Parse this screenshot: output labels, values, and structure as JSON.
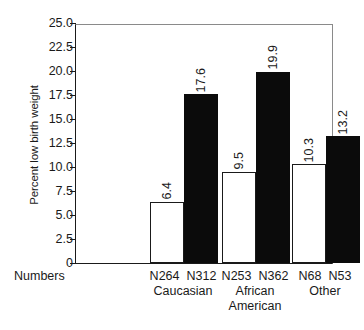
{
  "chart_data": {
    "type": "bar",
    "title": "",
    "xlabel": "",
    "ylabel": "Percent low birth weight",
    "ylim": [
      0,
      25.0
    ],
    "yticks": [
      "0",
      "2.5",
      "5.0",
      "7.5",
      "10.0",
      "12.5",
      "15.0",
      "17.5",
      "20.0",
      "22.5",
      "25.0"
    ],
    "ytick_values": [
      0,
      2.5,
      5,
      7.5,
      10,
      12.5,
      15,
      17.5,
      20,
      22.5,
      25
    ],
    "grid": false,
    "legend": "none",
    "categories": [
      "Caucasian",
      "African American",
      "Other"
    ],
    "series": [
      {
        "name": "open-bar",
        "style": "white-fill-black-outline",
        "values": [
          6.4,
          9.5,
          10.3
        ],
        "labels": [
          "6.4",
          "9.5",
          "10.3"
        ],
        "counts": [
          "N264",
          "N253",
          "N68"
        ]
      },
      {
        "name": "filled-bar",
        "style": "black-fill",
        "values": [
          17.6,
          19.9,
          13.2
        ],
        "labels": [
          "17.6",
          "19.9",
          "13.2"
        ],
        "counts": [
          "N312",
          "N362",
          "N53"
        ]
      }
    ],
    "row_header": "Numbers",
    "colors": {
      "open_bar_fill": "#ffffff",
      "open_bar_edge": "#1a1a1a",
      "filled_bar_fill": "#0b0b0b",
      "axis": "#1a1a1a",
      "frame": "#8a8a8a",
      "text": "#1a1a1a"
    }
  },
  "axis": {
    "y_title": "Percent low birth weight"
  },
  "groups": [
    {
      "name": "Caucasian",
      "n_open": "N264",
      "n_filled": "N312"
    },
    {
      "name": "African\nAmerican",
      "n_open": "N253",
      "n_filled": "N362"
    },
    {
      "name": "Other",
      "n_open": "N68",
      "n_filled": "N53"
    }
  ],
  "row_header": {
    "label": "Numbers"
  }
}
